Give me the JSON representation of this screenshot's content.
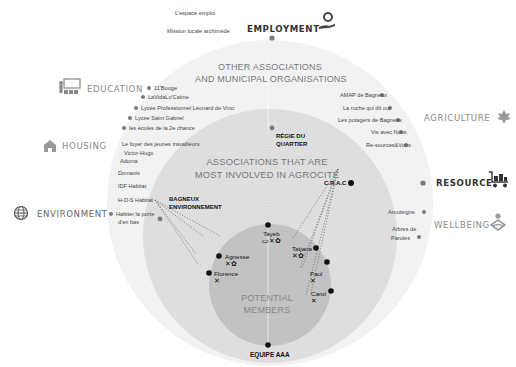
{
  "rings": {
    "outer_title": [
      "OTHER ASSOCIATIONS",
      "AND MUNICIPAL ORGANISATIONS"
    ],
    "middle_title": [
      "ASSOCIATIONS THAT ARE",
      "MOST INVOLVED IN AGROCITÉ"
    ],
    "inner_title": [
      "POTENTIAL",
      "MEMBERS"
    ]
  },
  "categories": {
    "employment": {
      "label": "EMPLOYMENT",
      "icon": "hand-gear-icon"
    },
    "education": {
      "label": "EDUCATION",
      "icon": "classroom-icon"
    },
    "housing": {
      "label": "HOUSING",
      "icon": "house-icon"
    },
    "environment": {
      "label": "ENVIRONMENT",
      "icon": "globe-icon"
    },
    "agriculture": {
      "label": "AGRICULTURE",
      "icon": "leaf-icon"
    },
    "resource": {
      "label": "RESOURCE",
      "icon": "cart-icon"
    },
    "wellbeing": {
      "label": "WELLBEING",
      "icon": "meditation-icon"
    }
  },
  "employment_orgs": [
    "L'espace emploi",
    "Mission locale archimède"
  ],
  "education_orgs": [
    "11'Bouge",
    "LaVidaLo'Calme",
    "Lycée Professionnel Léonard de Vinci",
    "Lycée Saint Gabriel",
    "les écoles de la 2e chance"
  ],
  "housing_orgs": [
    "Le foyer des jeunes travailleurs",
    "Victor-Hugo",
    "Adoma",
    "Domaxis",
    "IDF Habitat",
    "H-D-S Habitat"
  ],
  "environment_orgs": [
    "Habiter la porte",
    "d'en bas"
  ],
  "agriculture_orgs": [
    "AMAP de Bagneux",
    "La ruche qui dit oui",
    "Les potagers de Bagneux",
    "Vis avec Nous",
    "Re-sources&Vous"
  ],
  "wellbeing_orgs": [
    "Aroutsigne",
    "Arbres de",
    "Paroles"
  ],
  "involved": {
    "regie": [
      "RÉGIE DU",
      "QUARTIER"
    ],
    "bagneux": [
      "BAGNEUX",
      "ENVIRONNEMENT"
    ],
    "crac": "C.R.A.C",
    "equipe": "EQUIPE AAA"
  },
  "members": [
    {
      "name": "Tayeb",
      "icons": "▭✕✿"
    },
    {
      "name": "Agnesse",
      "icons": "✕✿"
    },
    {
      "name": "Tatjana",
      "icons": "✕✿"
    },
    {
      "name": "Florence",
      "icons": "✕"
    },
    {
      "name": "Paul",
      "icons": "✕"
    },
    {
      "name": "Carol",
      "icons": "✕"
    }
  ],
  "colors": {
    "outer_ring": "#f2f2f2",
    "middle_ring": "#dcdcdc",
    "inner_ring": "#bdbdbd",
    "dot_grey": "#7a7a7a",
    "dot_black": "#111111"
  }
}
